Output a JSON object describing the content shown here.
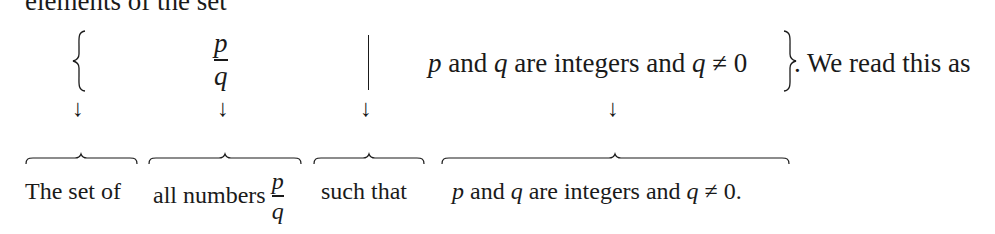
{
  "top_clipped_text": "elements of the set",
  "set_notation": {
    "open_brace": "{",
    "fraction": {
      "numerator": "p",
      "denominator": "q"
    },
    "separator": "|",
    "condition": {
      "p": "p",
      "and1": " and ",
      "q": "q",
      "middle": " are integers and ",
      "q2": "q",
      "neq": " ≠ 0"
    },
    "close_brace": "}",
    "trailing_text": ". We read this as"
  },
  "arrows": [
    "↓",
    "↓",
    "↓",
    "↓"
  ],
  "labels": {
    "set_of": "The set of",
    "all_numbers": "all numbers ",
    "all_numbers_fraction": {
      "numerator": "p",
      "denominator": "q"
    },
    "such_that": "such that",
    "condition": {
      "p": "p",
      "and1": " and ",
      "q": "q",
      "middle": " are integers and ",
      "q2": "q",
      "neq": " ≠ 0."
    }
  }
}
